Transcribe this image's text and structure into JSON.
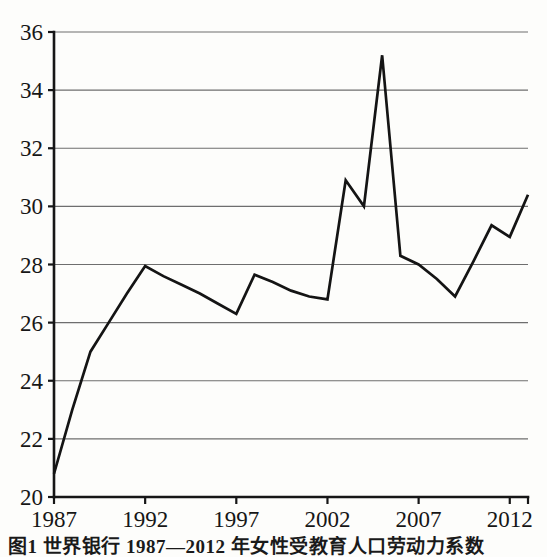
{
  "figure": {
    "caption": "图1  世界银行 1987—2012 年女性受教育人口劳动力系数"
  },
  "chart_data": {
    "type": "line",
    "title": "",
    "xlabel": "",
    "ylabel": "",
    "xlim": [
      1987,
      2013
    ],
    "ylim": [
      20,
      36
    ],
    "grid": true,
    "legend": false,
    "line_color": "#141414",
    "background_color": "#fdfdfb",
    "axis_color": "#161616",
    "gridline_color": "#6e6e6e",
    "y_ticks": [
      20,
      22,
      24,
      26,
      28,
      30,
      32,
      34,
      36
    ],
    "y_tick_labels": [
      "20",
      "22",
      "24",
      "26",
      "28",
      "30",
      "32",
      "34",
      "36"
    ],
    "x_ticks": [
      1987,
      1992,
      1997,
      2002,
      2007,
      2012
    ],
    "x_tick_labels": [
      "1987",
      "1992",
      "1997",
      "2002",
      "2007",
      "2012"
    ],
    "x": [
      1987,
      1988,
      1989,
      1990,
      1991,
      1992,
      1993,
      1994,
      1995,
      1996,
      1997,
      1998,
      1999,
      2000,
      2001,
      2002,
      2003,
      2004,
      2005,
      2006,
      2007,
      2008,
      2009,
      2010,
      2011,
      2012,
      2013
    ],
    "values": [
      20.8,
      23.0,
      25.0,
      26.0,
      27.0,
      27.95,
      27.6,
      27.3,
      27.0,
      26.65,
      26.3,
      27.65,
      27.4,
      27.1,
      26.9,
      26.8,
      30.9,
      30.0,
      35.2,
      28.3,
      28.0,
      27.5,
      26.9,
      28.1,
      29.35,
      28.95,
      30.4
    ],
    "series": [
      {
        "name": "series-1",
        "values": [
          20.8,
          23.0,
          25.0,
          26.0,
          27.0,
          27.95,
          27.6,
          27.3,
          27.0,
          26.65,
          26.3,
          27.65,
          27.4,
          27.1,
          26.9,
          26.8,
          30.9,
          30.0,
          35.2,
          28.3,
          28.0,
          27.5,
          26.9,
          28.1,
          29.35,
          28.95,
          30.4
        ]
      }
    ],
    "annotations": {
      "max_value": 35.2,
      "max_year": 2005,
      "min_value": 20.8,
      "min_year": 1987
    }
  }
}
